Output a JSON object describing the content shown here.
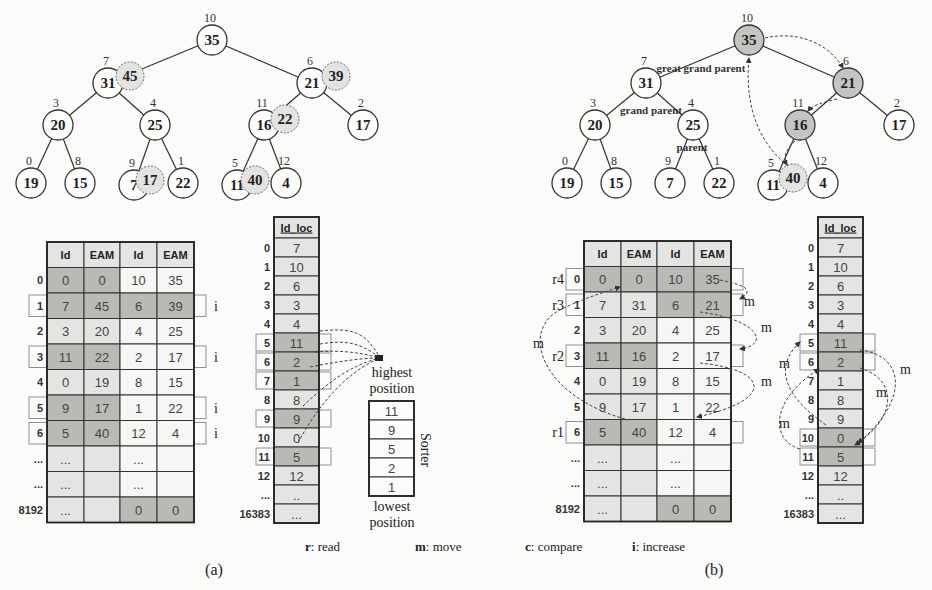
{
  "figure": {
    "panel_a_caption": "(a)",
    "panel_b_caption": "(b)",
    "legend": [
      {
        "key": "r",
        "text": ": read"
      },
      {
        "key": "m",
        "text": ": move"
      },
      {
        "key": "c",
        "text": ": compare"
      },
      {
        "key": "i",
        "text": ": increase"
      }
    ]
  },
  "colors": {
    "dark_cell": "#b9b9b6",
    "light_cell": "#e4e4e2",
    "white_cell": "#f6f6f4",
    "node_shaded": "#c4c4c2",
    "node_dashed_fill": "#e3e3e1",
    "line": "#333333"
  },
  "panel_a": {
    "tree": {
      "nodes": [
        {
          "id": "n35",
          "value": "35",
          "index": "10",
          "x": 212,
          "y": 40
        },
        {
          "id": "n31",
          "value": "31",
          "index": "7",
          "x": 108,
          "y": 83
        },
        {
          "id": "n21",
          "value": "21",
          "index": "6",
          "x": 312,
          "y": 83
        },
        {
          "id": "n20",
          "value": "20",
          "index": "3",
          "x": 58,
          "y": 125
        },
        {
          "id": "n25",
          "value": "25",
          "index": "4",
          "x": 155,
          "y": 125
        },
        {
          "id": "n16",
          "value": "16",
          "index": "11",
          "x": 264,
          "y": 125
        },
        {
          "id": "n17",
          "value": "17",
          "index": "2",
          "x": 363,
          "y": 125
        },
        {
          "id": "n19",
          "value": "19",
          "index": "0",
          "x": 31,
          "y": 183
        },
        {
          "id": "n15",
          "value": "15",
          "index": "8",
          "x": 80,
          "y": 183
        },
        {
          "id": "n7",
          "value": "7",
          "index": "9",
          "x": 134,
          "y": 185
        },
        {
          "id": "n22",
          "value": "22",
          "index": "1",
          "x": 183,
          "y": 183
        },
        {
          "id": "n11",
          "value": "11",
          "index": "5",
          "x": 237,
          "y": 185
        },
        {
          "id": "n4",
          "value": "4",
          "index": "12",
          "x": 286,
          "y": 183
        }
      ],
      "edges": [
        [
          "n35",
          "n31"
        ],
        [
          "n35",
          "n21"
        ],
        [
          "n31",
          "n20"
        ],
        [
          "n31",
          "n25"
        ],
        [
          "n21",
          "n16"
        ],
        [
          "n21",
          "n17"
        ],
        [
          "n20",
          "n19"
        ],
        [
          "n20",
          "n15"
        ],
        [
          "n25",
          "n7"
        ],
        [
          "n25",
          "n22"
        ],
        [
          "n16",
          "n11"
        ],
        [
          "n16",
          "n4"
        ]
      ],
      "increment_overlays": [
        {
          "value": "45",
          "x": 130,
          "y": 76
        },
        {
          "value": "39",
          "x": 336,
          "y": 76
        },
        {
          "value": "22",
          "x": 285,
          "y": 119
        },
        {
          "value": "17",
          "x": 150,
          "y": 180
        },
        {
          "value": "40",
          "x": 255,
          "y": 180
        }
      ]
    },
    "heap_table": {
      "headers": [
        "Id",
        "EAM",
        "Id",
        "EAM"
      ],
      "rows": [
        {
          "label": "0",
          "cells": [
            "0",
            "0",
            "10",
            "35"
          ],
          "shade": [
            "d",
            "d",
            "w",
            "w"
          ],
          "marker": ""
        },
        {
          "label": "1",
          "cells": [
            "7",
            "45",
            "6",
            "39"
          ],
          "shade": [
            "d",
            "d",
            "d",
            "d"
          ],
          "marker": "i"
        },
        {
          "label": "2",
          "cells": [
            "3",
            "20",
            "4",
            "25"
          ],
          "shade": [
            "l",
            "l",
            "w",
            "w"
          ],
          "marker": ""
        },
        {
          "label": "3",
          "cells": [
            "11",
            "22",
            "2",
            "17"
          ],
          "shade": [
            "d",
            "d",
            "w",
            "w"
          ],
          "marker": "i"
        },
        {
          "label": "4",
          "cells": [
            "0",
            "19",
            "8",
            "15"
          ],
          "shade": [
            "l",
            "l",
            "w",
            "w"
          ],
          "marker": ""
        },
        {
          "label": "5",
          "cells": [
            "9",
            "17",
            "1",
            "22"
          ],
          "shade": [
            "d",
            "d",
            "w",
            "w"
          ],
          "marker": "i"
        },
        {
          "label": "6",
          "cells": [
            "5",
            "40",
            "12",
            "4"
          ],
          "shade": [
            "d",
            "d",
            "w",
            "w"
          ],
          "marker": "i"
        },
        {
          "label": "...",
          "cells": [
            "...",
            "",
            "...",
            ""
          ],
          "shade": [
            "l",
            "l",
            "w",
            "w"
          ],
          "marker": ""
        },
        {
          "label": "...",
          "cells": [
            "...",
            "",
            "...",
            ""
          ],
          "shade": [
            "l",
            "l",
            "w",
            "w"
          ],
          "marker": ""
        },
        {
          "label": "8192",
          "cells": [
            "...",
            "",
            "0",
            "0"
          ],
          "shade": [
            "l",
            "l",
            "d",
            "d"
          ],
          "marker": ""
        }
      ]
    },
    "id_loc_table": {
      "header": "Id_loc",
      "rows": [
        {
          "label": "0",
          "value": "7",
          "shade": "l",
          "boxed": false
        },
        {
          "label": "1",
          "value": "10",
          "shade": "l",
          "boxed": false
        },
        {
          "label": "2",
          "value": "6",
          "shade": "l",
          "boxed": false
        },
        {
          "label": "3",
          "value": "3",
          "shade": "l",
          "boxed": false
        },
        {
          "label": "4",
          "value": "4",
          "shade": "l",
          "boxed": false
        },
        {
          "label": "5",
          "value": "11",
          "shade": "d",
          "boxed": true
        },
        {
          "label": "6",
          "value": "2",
          "shade": "d",
          "boxed": true
        },
        {
          "label": "7",
          "value": "1",
          "shade": "d",
          "boxed": true
        },
        {
          "label": "8",
          "value": "8",
          "shade": "l",
          "boxed": false
        },
        {
          "label": "9",
          "value": "9",
          "shade": "d",
          "boxed": true
        },
        {
          "label": "10",
          "value": "0",
          "shade": "l",
          "boxed": false
        },
        {
          "label": "11",
          "value": "5",
          "shade": "d",
          "boxed": true
        },
        {
          "label": "12",
          "value": "12",
          "shade": "l",
          "boxed": false
        },
        {
          "label": "...",
          "value": "..",
          "shade": "l",
          "boxed": false
        },
        {
          "label": "16383",
          "value": "...",
          "shade": "l",
          "boxed": false
        }
      ]
    },
    "sorter": {
      "title": "Sorter",
      "top_label_1": "highest",
      "top_label_2": "position",
      "bottom_label_1": "lowest",
      "bottom_label_2": "position",
      "values": [
        "11",
        "9",
        "5",
        "2",
        "1"
      ]
    }
  },
  "panel_b": {
    "tree": {
      "nodes": [
        {
          "id": "m35",
          "value": "35",
          "index": "10",
          "x": 749,
          "y": 40,
          "shaded": true
        },
        {
          "id": "m31",
          "value": "31",
          "index": "7",
          "x": 646,
          "y": 83,
          "shaded": false
        },
        {
          "id": "m21",
          "value": "21",
          "index": "6",
          "x": 848,
          "y": 83,
          "shaded": true
        },
        {
          "id": "m20",
          "value": "20",
          "index": "3",
          "x": 595,
          "y": 125,
          "shaded": false
        },
        {
          "id": "m25",
          "value": "25",
          "index": "4",
          "x": 693,
          "y": 125,
          "shaded": false
        },
        {
          "id": "m16",
          "value": "16",
          "index": "11",
          "x": 800,
          "y": 125,
          "shaded": true
        },
        {
          "id": "m17",
          "value": "17",
          "index": "2",
          "x": 899,
          "y": 125,
          "shaded": false
        },
        {
          "id": "m19",
          "value": "19",
          "index": "0",
          "x": 567,
          "y": 183,
          "shaded": false
        },
        {
          "id": "m15",
          "value": "15",
          "index": "8",
          "x": 616,
          "y": 183,
          "shaded": false
        },
        {
          "id": "m7",
          "value": "7",
          "index": "9",
          "x": 670,
          "y": 183,
          "shaded": false
        },
        {
          "id": "m22",
          "value": "22",
          "index": "1",
          "x": 719,
          "y": 183,
          "shaded": false
        },
        {
          "id": "m11",
          "value": "11",
          "index": "5",
          "x": 773,
          "y": 185,
          "shaded": false
        },
        {
          "id": "m4",
          "value": "4",
          "index": "12",
          "x": 823,
          "y": 183,
          "shaded": false
        }
      ],
      "edges": [
        [
          "m35",
          "m31"
        ],
        [
          "m35",
          "m21"
        ],
        [
          "m31",
          "m20"
        ],
        [
          "m31",
          "m25"
        ],
        [
          "m21",
          "m16"
        ],
        [
          "m21",
          "m17"
        ],
        [
          "m20",
          "m19"
        ],
        [
          "m20",
          "m15"
        ],
        [
          "m25",
          "m7"
        ],
        [
          "m25",
          "m22"
        ],
        [
          "m16",
          "m11"
        ],
        [
          "m16",
          "m4"
        ]
      ],
      "increment_overlays": [
        {
          "value": "40",
          "x": 793,
          "y": 178
        }
      ],
      "annotations": {
        "great_grand_parent": "great grand parent",
        "grand_parent": "grand parent",
        "parent": "parent"
      }
    },
    "heap_table": {
      "headers": [
        "Id",
        "EAM",
        "Id",
        "EAM"
      ],
      "rows": [
        {
          "label": "0",
          "read": "r4",
          "cells": [
            "0",
            "0",
            "10",
            "35"
          ],
          "shade": [
            "d",
            "d",
            "d",
            "d"
          ]
        },
        {
          "label": "1",
          "read": "r3",
          "cells": [
            "7",
            "31",
            "6",
            "21"
          ],
          "shade": [
            "l",
            "l",
            "d",
            "d"
          ]
        },
        {
          "label": "2",
          "read": "",
          "cells": [
            "3",
            "20",
            "4",
            "25"
          ],
          "shade": [
            "l",
            "l",
            "w",
            "w"
          ]
        },
        {
          "label": "3",
          "read": "r2",
          "cells": [
            "11",
            "16",
            "2",
            "17"
          ],
          "shade": [
            "d",
            "d",
            "w",
            "w"
          ]
        },
        {
          "label": "4",
          "read": "",
          "cells": [
            "0",
            "19",
            "8",
            "15"
          ],
          "shade": [
            "l",
            "l",
            "w",
            "w"
          ]
        },
        {
          "label": "5",
          "read": "",
          "cells": [
            "9",
            "17",
            "1",
            "22"
          ],
          "shade": [
            "l",
            "l",
            "w",
            "w"
          ]
        },
        {
          "label": "6",
          "read": "r1",
          "cells": [
            "5",
            "40",
            "12",
            "4"
          ],
          "shade": [
            "d",
            "d",
            "w",
            "w"
          ]
        },
        {
          "label": "...",
          "read": "",
          "cells": [
            "...",
            "",
            "...",
            ""
          ],
          "shade": [
            "l",
            "l",
            "w",
            "w"
          ]
        },
        {
          "label": "...",
          "read": "",
          "cells": [
            "...",
            "",
            "...",
            ""
          ],
          "shade": [
            "l",
            "l",
            "w",
            "w"
          ]
        },
        {
          "label": "8192",
          "read": "",
          "cells": [
            "...",
            "",
            "0",
            "0"
          ],
          "shade": [
            "l",
            "l",
            "d",
            "d"
          ]
        }
      ],
      "move_label": "m"
    },
    "id_loc_table": {
      "header": "Id_loc",
      "rows": [
        {
          "label": "0",
          "value": "7",
          "shade": "l",
          "boxed": false
        },
        {
          "label": "1",
          "value": "10",
          "shade": "l",
          "boxed": false
        },
        {
          "label": "2",
          "value": "6",
          "shade": "l",
          "boxed": false
        },
        {
          "label": "3",
          "value": "3",
          "shade": "l",
          "boxed": false
        },
        {
          "label": "4",
          "value": "4",
          "shade": "l",
          "boxed": false
        },
        {
          "label": "5",
          "value": "11",
          "shade": "d",
          "boxed": true
        },
        {
          "label": "6",
          "value": "2",
          "shade": "d",
          "boxed": true
        },
        {
          "label": "7",
          "value": "1",
          "shade": "l",
          "boxed": false
        },
        {
          "label": "8",
          "value": "8",
          "shade": "l",
          "boxed": false
        },
        {
          "label": "9",
          "value": "9",
          "shade": "l",
          "boxed": false
        },
        {
          "label": "10",
          "value": "0",
          "shade": "d",
          "boxed": true
        },
        {
          "label": "11",
          "value": "5",
          "shade": "d",
          "boxed": true
        },
        {
          "label": "12",
          "value": "12",
          "shade": "l",
          "boxed": false
        },
        {
          "label": "...",
          "value": "..",
          "shade": "l",
          "boxed": false
        },
        {
          "label": "16383",
          "value": "...",
          "shade": "l",
          "boxed": false
        }
      ],
      "move_label": "m"
    }
  }
}
